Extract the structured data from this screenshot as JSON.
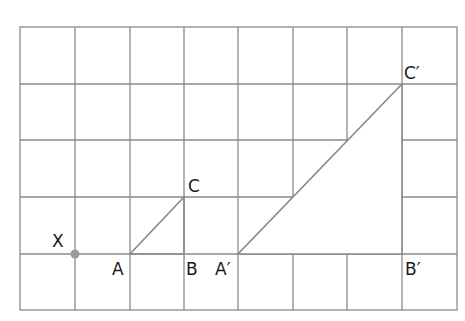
{
  "diagram": {
    "type": "grid-enlargement",
    "grid": {
      "columns": 8,
      "rows": 5,
      "origin_px": [
        20,
        27
      ],
      "cell_w": 54.6,
      "cell_h": 56.6,
      "line_color": "#8a8a8a"
    },
    "center_of_enlargement": {
      "label": "X",
      "grid": [
        1,
        4
      ],
      "color": "#9a9a9a"
    },
    "triangle_original": {
      "vertices": [
        {
          "label": "A",
          "grid": [
            2,
            4
          ]
        },
        {
          "label": "B",
          "grid": [
            3,
            4
          ]
        },
        {
          "label": "C",
          "grid": [
            3,
            3
          ]
        }
      ]
    },
    "triangle_image": {
      "vertices": [
        {
          "label": "A′",
          "grid": [
            4,
            4
          ]
        },
        {
          "label": "B′",
          "grid": [
            7,
            4
          ]
        },
        {
          "label": "C′",
          "grid": [
            7,
            1
          ]
        }
      ]
    },
    "shape_line_color": "#8a8a8a",
    "labels": {
      "X": "X",
      "A": "A",
      "B": "B",
      "C": "C",
      "A_prime": "A′",
      "B_prime": "B′",
      "C_prime": "C′"
    }
  }
}
